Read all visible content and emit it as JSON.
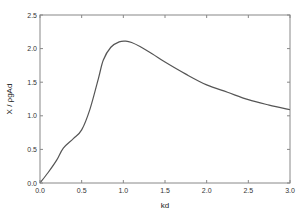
{
  "chart_data": {
    "type": "line",
    "title": "",
    "xlabel": "kd",
    "ylabel": "X / ρgAd",
    "xlim": [
      0,
      3.0
    ],
    "ylim": [
      0,
      2.5
    ],
    "grid": false,
    "legend": null,
    "x_ticks": [
      "0.0",
      "0.5",
      "1.0",
      "1.5",
      "2.0",
      "2.5",
      "3.0"
    ],
    "y_ticks": [
      "0.0",
      "0.5",
      "1.0",
      "1.5",
      "2.0",
      "2.5"
    ],
    "series": [
      {
        "name": "X / ρgAd",
        "color": "#555555",
        "x": [
          0.0,
          0.1,
          0.2,
          0.28,
          0.4,
          0.5,
          0.6,
          0.7,
          0.76,
          0.85,
          0.95,
          1.03,
          1.1,
          1.2,
          1.35,
          1.5,
          1.75,
          2.0,
          2.25,
          2.5,
          2.75,
          3.0
        ],
        "y": [
          0.0,
          0.16,
          0.34,
          0.52,
          0.66,
          0.79,
          1.1,
          1.55,
          1.83,
          2.02,
          2.1,
          2.11,
          2.09,
          2.03,
          1.92,
          1.8,
          1.62,
          1.46,
          1.35,
          1.24,
          1.16,
          1.09
        ]
      }
    ]
  }
}
